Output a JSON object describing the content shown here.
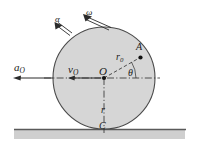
{
  "figure": {
    "colors": {
      "disk_fill": "#d4d4d4",
      "disk_stroke": "#4a4a4a",
      "line": "#2b2b2b",
      "ground_line": "#555555",
      "ground_band": "#cfcfcf",
      "background": "#ffffff"
    },
    "labels": {
      "angular_acceleration": "α",
      "angular_velocity": "ω",
      "center_acceleration": "a",
      "center_acceleration_sub": "O",
      "center_velocity": "v",
      "center_velocity_sub": "O",
      "center_point": "O",
      "radius_to_A": "r",
      "radius_to_A_sub": "0",
      "point_A": "A",
      "angle": "θ",
      "disk_radius": "r",
      "contact_point": "C"
    },
    "geometry": {
      "disk_center_x": 104,
      "disk_center_y": 78,
      "disk_radius": 51,
      "point_A_x": 140,
      "point_A_y": 58,
      "ground_y": 129
    }
  }
}
